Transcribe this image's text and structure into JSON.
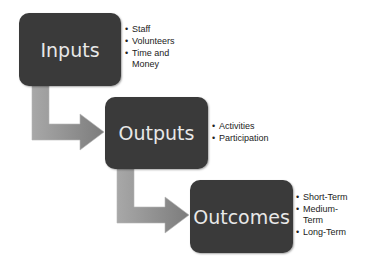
{
  "diagram": {
    "stages": [
      {
        "label": "Inputs",
        "bullets": [
          "Staff",
          "Volunteers",
          "Time and Money"
        ]
      },
      {
        "label": "Outputs",
        "bullets": [
          "Activities",
          "Participation"
        ]
      },
      {
        "label": "Outcomes",
        "bullets": [
          "Short-Term",
          "Medium-Term",
          "Long-Term"
        ]
      }
    ],
    "colors": {
      "box": "#3a3a3a",
      "box_text": "#e8e8e8",
      "arrow": "#8f8f8f"
    }
  }
}
